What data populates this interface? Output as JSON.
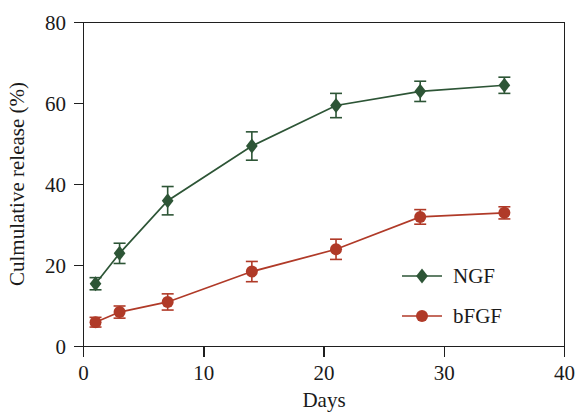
{
  "chart_data": {
    "type": "line",
    "title": "",
    "subtitle": "",
    "xlabel": "Days",
    "ylabel": "Culmulative release (%)",
    "xlim": [
      0,
      40
    ],
    "ylim": [
      0,
      80
    ],
    "xticks": [
      0,
      10,
      20,
      30,
      40
    ],
    "yticks": [
      0,
      20,
      40,
      60,
      80
    ],
    "xtick_labels": [
      "0",
      "10",
      "20",
      "30",
      "40"
    ],
    "ytick_labels": [
      "0",
      "20",
      "40",
      "60",
      "80"
    ],
    "grid": false,
    "legend_position": "lower right inside",
    "x": [
      1,
      3,
      7,
      14,
      21,
      28,
      35
    ],
    "series": [
      {
        "name": "NGF",
        "color": "#2d5536",
        "marker": "diamond",
        "values": [
          15.5,
          23.0,
          36.0,
          49.5,
          59.5,
          63.0,
          64.5
        ],
        "errors": [
          1.5,
          2.5,
          3.5,
          3.5,
          3.0,
          2.5,
          2.0
        ]
      },
      {
        "name": "bFGF",
        "color": "#b03a28",
        "marker": "circle",
        "values": [
          6.0,
          8.5,
          11.0,
          18.5,
          24.0,
          32.0,
          33.0
        ],
        "errors": [
          1.2,
          1.5,
          2.0,
          2.5,
          2.5,
          1.8,
          1.5
        ]
      }
    ]
  },
  "axes": {
    "y_axis_title": "Culmulative release (%)",
    "x_axis_title": "Days",
    "y_tick_labels": [
      "80",
      "60",
      "40",
      "20",
      "0"
    ],
    "x_tick_labels": [
      "0",
      "10",
      "20",
      "30",
      "40"
    ]
  },
  "legend": {
    "entries": [
      {
        "label": "NGF",
        "color": "#2d5536",
        "marker": "diamond-icon"
      },
      {
        "label": "bFGF",
        "color": "#b03a28",
        "marker": "circle-icon"
      }
    ]
  },
  "colors": {
    "ngf": "#2d5536",
    "bfgf": "#b03a28",
    "axis": "#1f1f1f",
    "background": "#ffffff"
  }
}
